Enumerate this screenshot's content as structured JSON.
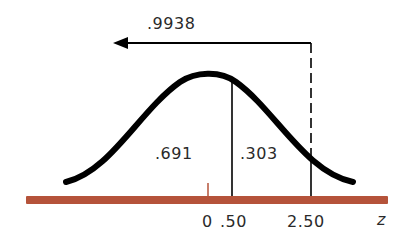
{
  "diagram": {
    "type": "normal-distribution",
    "arrow_label": ".9938",
    "areas": {
      "left_of_050": ".691",
      "between_050_250": ".303"
    },
    "axis": {
      "ticks": [
        "0",
        ".50",
        "2.50"
      ],
      "variable_label": "z"
    },
    "colors": {
      "curve": "#000000",
      "axis_bar": "#b5533a",
      "center_tick": "#b5533a",
      "text": "#2a2a2a"
    }
  }
}
